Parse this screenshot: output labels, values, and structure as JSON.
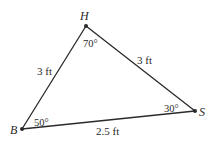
{
  "diagram": {
    "type": "triangle",
    "vertices": [
      {
        "name": "H",
        "x": 86,
        "y": 26,
        "angle": "70°"
      },
      {
        "name": "B",
        "x": 22,
        "y": 129,
        "angle": "50°"
      },
      {
        "name": "S",
        "x": 195,
        "y": 111,
        "angle": "30°"
      }
    ],
    "sides": [
      {
        "from": "B",
        "to": "H",
        "length": "3 ft"
      },
      {
        "from": "H",
        "to": "S",
        "length": "3 ft"
      },
      {
        "from": "B",
        "to": "S",
        "length": "2.5 ft"
      }
    ],
    "colors": {
      "line": "#2a2a2a",
      "text": "#2a2a2a",
      "background": "#ffffff"
    }
  }
}
